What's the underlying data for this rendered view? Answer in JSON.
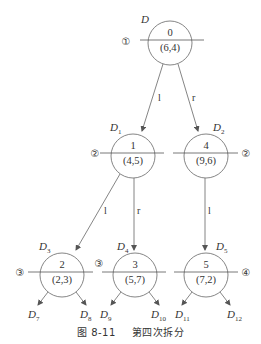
{
  "figure": {
    "caption_number": "图 8-11",
    "caption_title": "第四次拆分"
  },
  "nodes": {
    "root": {
      "label": "D",
      "sub": "",
      "index": "0",
      "point": "(6,4)",
      "step": "①"
    },
    "n1": {
      "label": "D",
      "sub": "1",
      "index": "1",
      "point": "(4,5)",
      "step": "②"
    },
    "n4": {
      "label": "D",
      "sub": "2",
      "index": "4",
      "point": "(9,6)",
      "step": "②"
    },
    "n2": {
      "label": "D",
      "sub": "3",
      "index": "2",
      "point": "(2,3)",
      "step": "③"
    },
    "n3": {
      "label": "D",
      "sub": "4",
      "index": "3",
      "point": "(5,7)",
      "step": "③"
    },
    "n5": {
      "label": "D",
      "sub": "5",
      "index": "5",
      "point": "(7,2)",
      "step": "④"
    }
  },
  "edges": {
    "root_l": "l",
    "root_r": "r",
    "n1_l": "l",
    "n1_r": "r",
    "n4_l": "l"
  },
  "leaves": [
    {
      "label": "D",
      "sub": "7"
    },
    {
      "label": "D",
      "sub": "8"
    },
    {
      "label": "D",
      "sub": "9"
    },
    {
      "label": "D",
      "sub": "10"
    },
    {
      "label": "D",
      "sub": "11"
    },
    {
      "label": "D",
      "sub": "12"
    }
  ]
}
